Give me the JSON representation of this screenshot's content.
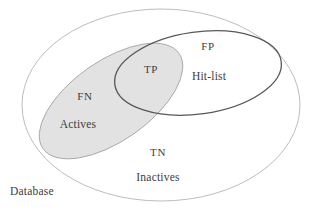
{
  "diagram": {
    "type": "venn",
    "colors": {
      "background": "#ffffff",
      "outer_stroke": "#b4b4b4",
      "hitlist_stroke": "#585858",
      "actives_fill": "#e2e2e2",
      "actives_stroke": "#a8a8a8",
      "text": "#3d3d3d"
    },
    "sets": [
      {
        "id": "database",
        "name": "Database",
        "label": "Database",
        "shape": "ellipse",
        "cx": 161,
        "cy": 105,
        "rx": 139,
        "ry": 96,
        "rotation": 0,
        "fill": "none",
        "stroke": "#b4b4b4",
        "stroke_width": 0.9
      },
      {
        "id": "hitlist",
        "name": "Hit-list",
        "label": "Hit-list",
        "shape": "ellipse",
        "cx": 198,
        "cy": 73,
        "rx": 84,
        "ry": 41,
        "rotation": -8,
        "fill": "none",
        "stroke": "#585858",
        "stroke_width": 1.3
      },
      {
        "id": "actives",
        "name": "Actives",
        "label": "Actives",
        "shape": "ellipse",
        "cx": 111,
        "cy": 101,
        "rx": 83,
        "ry": 40,
        "rotation": -35,
        "fill": "#e2e2e2",
        "stroke": "#a8a8a8",
        "stroke_width": 0.9
      }
    ],
    "labels": [
      {
        "id": "fp",
        "text": "FP",
        "x": 208,
        "y": 47,
        "region": "hitlist-only"
      },
      {
        "id": "hitlist",
        "text": "Hit-list",
        "x": 209,
        "y": 77,
        "region": "hitlist-only"
      },
      {
        "id": "tp",
        "text": "TP",
        "x": 151,
        "y": 70,
        "region": "actives-and-hitlist"
      },
      {
        "id": "fn",
        "text": "FN",
        "x": 85,
        "y": 97,
        "region": "actives-only"
      },
      {
        "id": "actives",
        "text": "Actives",
        "x": 78,
        "y": 125,
        "region": "actives-only"
      },
      {
        "id": "tn",
        "text": "TN",
        "x": 158,
        "y": 153,
        "region": "database-only"
      },
      {
        "id": "inactives",
        "text": "Inactives",
        "x": 158,
        "y": 178,
        "region": "database-only"
      },
      {
        "id": "database",
        "text": "Database",
        "x": 10,
        "y": 192,
        "region": "outside-corner"
      }
    ]
  }
}
